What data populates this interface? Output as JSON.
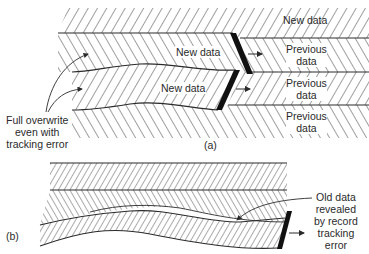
{
  "figure": {
    "part_a": {
      "caption": "(a)",
      "labels": {
        "new_data_top": "New data",
        "new_data_track1": "New data",
        "new_data_track2": "New data",
        "previous_data_1": [
          "Previous",
          "data"
        ],
        "previous_data_2": [
          "Previous",
          "data"
        ],
        "previous_data_3": [
          "Previous",
          "data"
        ],
        "full_overwrite": [
          "Full overwrite",
          "even with",
          "tracking error"
        ]
      }
    },
    "part_b": {
      "caption": "(b)",
      "labels": {
        "old_data_revealed": [
          "Old data",
          "revealed",
          "by record",
          "tracking",
          "error"
        ]
      }
    },
    "colors": {
      "line": "#2a2a2a",
      "head": "#111111",
      "background": "#ffffff"
    }
  }
}
